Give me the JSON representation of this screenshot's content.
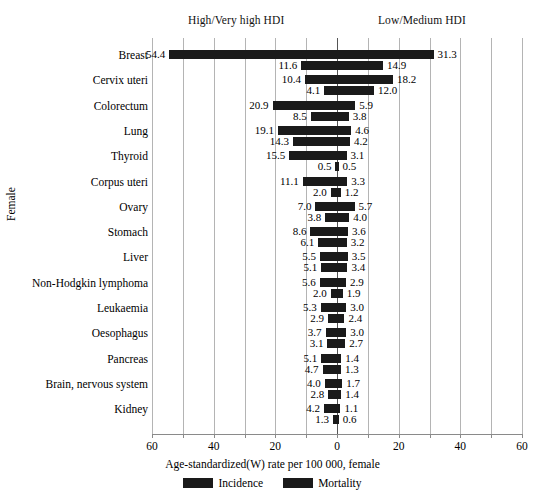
{
  "header": {
    "left_group": "High/Very high HDI",
    "right_group": "Low/Medium HDI"
  },
  "axis": {
    "xlabel": "Age-standardized(W) rate per 100 000, female",
    "ylabel": "Female",
    "tick_labels": [
      "60",
      "40",
      "20",
      "0",
      "20",
      "40",
      "60"
    ]
  },
  "legend": {
    "items": [
      {
        "label": "Incidence",
        "color": "#1a1a1a"
      },
      {
        "label": "Mortality",
        "color": "#1a1a1a"
      }
    ]
  },
  "chart_data": {
    "type": "bar",
    "title": "",
    "subtitle": "",
    "xlabel": "Age-standardized(W) rate per 100 000, female",
    "ylabel": "Female",
    "orientation": "horizontal-diverging",
    "grid": true,
    "legend_position": "bottom",
    "xlim": [
      -60,
      60
    ],
    "xticks": [
      -60,
      -40,
      -20,
      0,
      20,
      40,
      60
    ],
    "xtick_labels": [
      "60",
      "40",
      "20",
      "0",
      "20",
      "40",
      "60"
    ],
    "left_panel": "High/Very high HDI",
    "right_panel": "Low/Medium HDI",
    "categories": [
      "Breast",
      "Cervix uteri",
      "Colorectum",
      "Lung",
      "Thyroid",
      "Corpus uteri",
      "Ovary",
      "Stomach",
      "Liver",
      "Non-Hodgkin lymphoma",
      "Leukaemia",
      "Oesophagus",
      "Pancreas",
      "Brain, nervous system",
      "Kidney"
    ],
    "series": [
      {
        "name": "Incidence",
        "panel": "High/Very high HDI",
        "side": "left",
        "values": [
          54.4,
          10.4,
          20.9,
          19.1,
          15.5,
          11.1,
          7.0,
          8.6,
          5.5,
          5.6,
          5.3,
          3.7,
          5.1,
          4.0,
          4.2
        ]
      },
      {
        "name": "Incidence",
        "panel": "Low/Medium HDI",
        "side": "right",
        "values": [
          31.3,
          18.2,
          5.9,
          4.6,
          3.1,
          3.3,
          5.7,
          3.6,
          3.5,
          2.9,
          3.0,
          3.0,
          1.4,
          1.7,
          1.1
        ]
      },
      {
        "name": "Mortality",
        "panel": "High/Very high HDI",
        "side": "left",
        "values": [
          11.6,
          4.1,
          8.5,
          14.3,
          0.5,
          2.0,
          3.8,
          6.1,
          5.1,
          2.0,
          2.9,
          3.1,
          4.7,
          2.8,
          1.3
        ]
      },
      {
        "name": "Mortality",
        "panel": "Low/Medium HDI",
        "side": "right",
        "values": [
          14.9,
          12.0,
          3.8,
          4.2,
          0.5,
          1.2,
          4.0,
          3.2,
          3.4,
          1.9,
          2.4,
          2.7,
          1.3,
          1.4,
          0.6
        ]
      }
    ],
    "rows": [
      {
        "category": "Breast",
        "incidence_left": 54.4,
        "incidence_right": 31.3,
        "mortality_left": 11.6,
        "mortality_right": 14.9
      },
      {
        "category": "Cervix uteri",
        "incidence_left": 10.4,
        "incidence_right": 18.2,
        "mortality_left": 4.1,
        "mortality_right": 12.0
      },
      {
        "category": "Colorectum",
        "incidence_left": 20.9,
        "incidence_right": 5.9,
        "mortality_left": 8.5,
        "mortality_right": 3.8
      },
      {
        "category": "Lung",
        "incidence_left": 19.1,
        "incidence_right": 4.6,
        "mortality_left": 14.3,
        "mortality_right": 4.2
      },
      {
        "category": "Thyroid",
        "incidence_left": 15.5,
        "incidence_right": 3.1,
        "mortality_left": 0.5,
        "mortality_right": 0.5
      },
      {
        "category": "Corpus uteri",
        "incidence_left": 11.1,
        "incidence_right": 3.3,
        "mortality_left": 2.0,
        "mortality_right": 1.2
      },
      {
        "category": "Ovary",
        "incidence_left": 7.0,
        "incidence_right": 5.7,
        "mortality_left": 3.8,
        "mortality_right": 4.0
      },
      {
        "category": "Stomach",
        "incidence_left": 8.6,
        "incidence_right": 3.6,
        "mortality_left": 6.1,
        "mortality_right": 3.2
      },
      {
        "category": "Liver",
        "incidence_left": 5.5,
        "incidence_right": 3.5,
        "mortality_left": 5.1,
        "mortality_right": 3.4
      },
      {
        "category": "Non-Hodgkin lymphoma",
        "incidence_left": 5.6,
        "incidence_right": 2.9,
        "mortality_left": 2.0,
        "mortality_right": 1.9
      },
      {
        "category": "Leukaemia",
        "incidence_left": 5.3,
        "incidence_right": 3.0,
        "mortality_left": 2.9,
        "mortality_right": 2.4
      },
      {
        "category": "Oesophagus",
        "incidence_left": 3.7,
        "incidence_right": 3.0,
        "mortality_left": 3.1,
        "mortality_right": 2.7
      },
      {
        "category": "Pancreas",
        "incidence_left": 5.1,
        "incidence_right": 1.4,
        "mortality_left": 4.7,
        "mortality_right": 1.3
      },
      {
        "category": "Brain, nervous system",
        "incidence_left": 4.0,
        "incidence_right": 1.7,
        "mortality_left": 2.8,
        "mortality_right": 1.4
      },
      {
        "category": "Kidney",
        "incidence_left": 4.2,
        "incidence_right": 1.1,
        "mortality_left": 1.3,
        "mortality_right": 0.6
      }
    ]
  }
}
